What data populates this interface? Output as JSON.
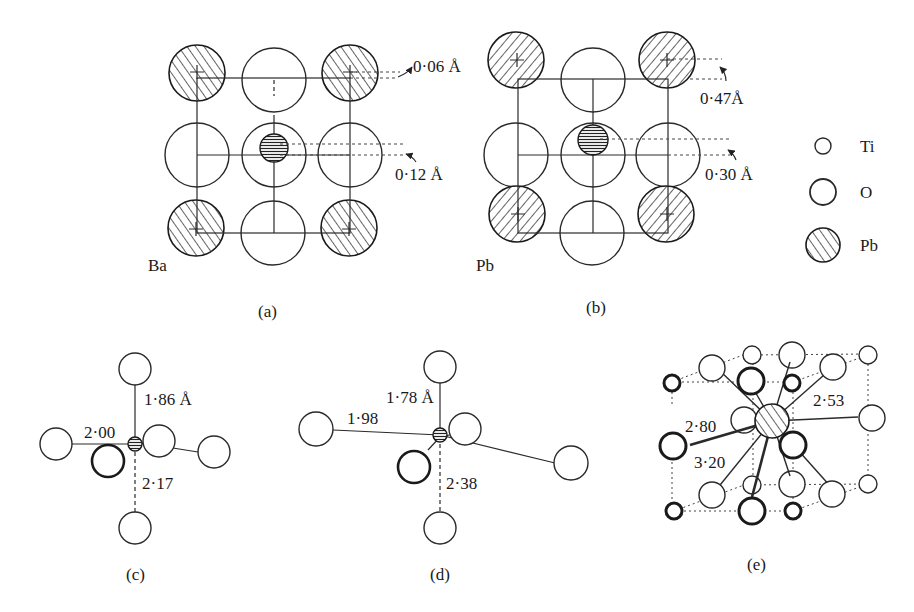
{
  "figure": {
    "panels": {
      "a": {
        "caption": "(a)",
        "corner_label": "Ba",
        "annotations": {
          "top": "0·06 Å",
          "middle": "0·12 Å"
        }
      },
      "b": {
        "caption": "(b)",
        "corner_label": "Pb",
        "annotations": {
          "top": "0·47Å",
          "middle": "0·30 Å"
        }
      },
      "c": {
        "caption": "(c)",
        "bond_lengths": {
          "top": "1·86 Å",
          "left": "2·00",
          "bottom": "2·17"
        }
      },
      "d": {
        "caption": "(d)",
        "bond_lengths": {
          "top": "1·78 Å",
          "left": "1·98",
          "bottom": "2·38"
        }
      },
      "e": {
        "caption": "(e)",
        "bond_lengths": {
          "upper_right": "2·53",
          "left_upper": "2·80",
          "left_lower": "3·20"
        }
      }
    },
    "legend": [
      {
        "symbol": "small-open-circle",
        "label": "Ti"
      },
      {
        "symbol": "large-open-circle",
        "label": "O"
      },
      {
        "symbol": "hatched-circle",
        "label": "Pb"
      }
    ]
  }
}
